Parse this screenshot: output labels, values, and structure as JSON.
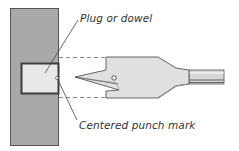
{
  "diagram": {
    "labels": {
      "plug": "Plug or dowel",
      "punch": "Centered punch mark"
    },
    "colors": {
      "board_fill": "#a8a8a8",
      "board_stroke": "#555555",
      "plug_fill": "#e6e6e6",
      "plug_stroke": "#404040",
      "bit_fill": "#dcdcdc",
      "bit_stroke": "#555555",
      "dashed_line": "#666666",
      "leader_line": "#444444"
    },
    "elements": [
      {
        "name": "workpiece-board",
        "type": "rect"
      },
      {
        "name": "plug-dowel",
        "type": "rect"
      },
      {
        "name": "spade-bit",
        "type": "shape"
      },
      {
        "name": "alignment-guides",
        "type": "dashed-lines"
      }
    ]
  }
}
